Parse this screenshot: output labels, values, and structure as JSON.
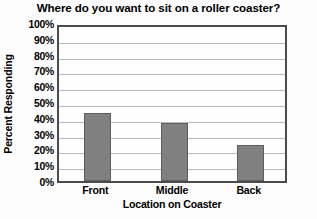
{
  "chart_data": {
    "type": "bar",
    "title": "Where do you want to sit on a roller coaster?",
    "xlabel": "Location on Coaster",
    "ylabel": "Percent Responding",
    "categories": [
      "Front",
      "Middle",
      "Back"
    ],
    "values": [
      43,
      37,
      23
    ],
    "ylim": [
      0,
      100
    ],
    "ytick_step": 10,
    "ytick_labels": [
      "100%",
      "90%",
      "80%",
      "70%",
      "60%",
      "50%",
      "40%",
      "30%",
      "20%",
      "10%",
      "0%"
    ],
    "ytick_values": [
      100,
      90,
      80,
      70,
      60,
      50,
      40,
      30,
      20,
      10,
      0
    ],
    "grid": true,
    "legend": false,
    "series": [
      {
        "name": "Percent Responding",
        "values": [
          43,
          37,
          23
        ]
      }
    ],
    "colors": {
      "bar_fill": "#808080",
      "bar_stroke": "#5e5e5e",
      "gridline": "#b9b9b9",
      "axis_frame": "#4b4b4b",
      "plot_background": "#fefefe",
      "text": "#000000"
    }
  }
}
